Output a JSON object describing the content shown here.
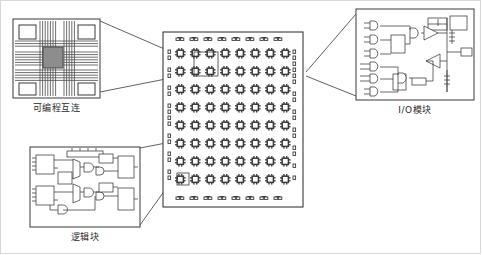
{
  "figure": {
    "type": "fpga-architecture-diagram",
    "background": "#ffffff",
    "frame_color": "#d8d8d8",
    "line_color": "#3a3a3a",
    "fill_gray": "#8d8d8d"
  },
  "callouts": [
    {
      "id": "programmable-interconnect",
      "caption": "可编程互连",
      "caption_x": 56,
      "caption_y": 104,
      "box": {
        "x": 13,
        "y": 19,
        "w": 87,
        "h": 79
      },
      "target": {
        "x": 200,
        "y": 58
      },
      "detail": {
        "corner_blocks": 4,
        "switch_box": {
          "x": 43,
          "y": 47,
          "w": 20,
          "h": 21,
          "fill": "#8d8d8d"
        },
        "h_channels": 14,
        "v_channels": 14
      }
    },
    {
      "id": "logic-block",
      "caption": "逻辑块",
      "caption_x": 88,
      "caption_y": 234,
      "box": {
        "x": 30,
        "y": 147,
        "w": 110,
        "h": 80
      },
      "target": {
        "x": 196,
        "y": 152
      },
      "detail": {
        "luts": 2,
        "muxes": 3,
        "gates": 6,
        "flipflops": 4,
        "input_lines": 10
      }
    },
    {
      "id": "io-module",
      "caption": "I/O模块",
      "caption_x": 408,
      "caption_y": 108,
      "box": {
        "x": 356,
        "y": 9,
        "w": 118,
        "h": 91
      },
      "target": {
        "x": 308,
        "y": 76
      },
      "detail": {
        "and_gates": 6,
        "tristate_buffers": 2,
        "registers": 3,
        "pad": 1
      }
    }
  ],
  "die": {
    "id": "fpga-die",
    "box": {
      "x": 163,
      "y": 32,
      "w": 140,
      "h": 175
    },
    "grid": {
      "cols": 8,
      "rows": 8,
      "cell": 13,
      "origin_x": 175,
      "origin_y": 50
    },
    "top_pads": 8,
    "bottom_pads": 8,
    "left_pads": 16,
    "right_pads": 16,
    "highlight_interconnect": {
      "x": 195,
      "y": 51,
      "w": 22,
      "h": 22
    },
    "highlight_logic": {
      "x": 178,
      "y": 180,
      "w": 11,
      "h": 11
    }
  }
}
